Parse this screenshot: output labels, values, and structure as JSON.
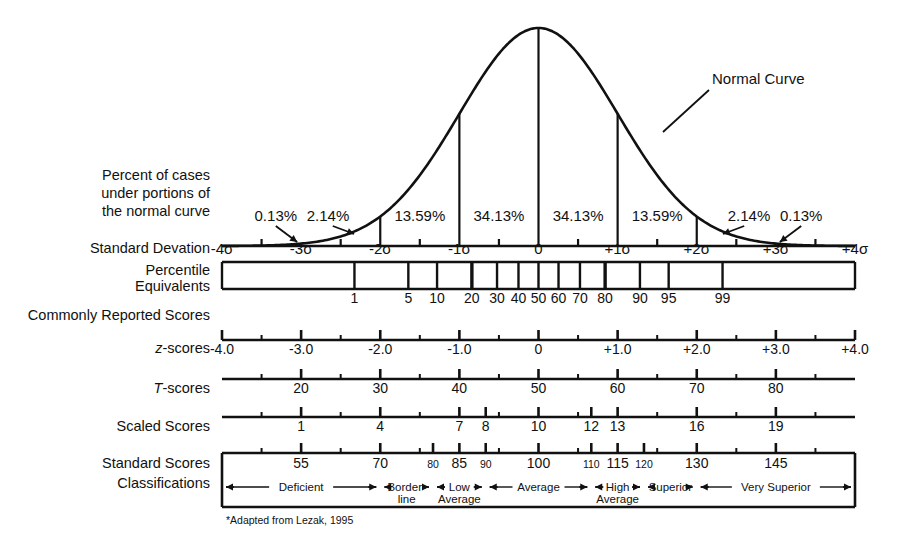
{
  "figure": {
    "curve_label": "Normal Curve",
    "footnote": "*Adapted from Lezak, 1995",
    "ink_color": "#111111",
    "background": "#ffffff"
  },
  "row_labels": {
    "percent_of_cases": [
      "Percent of cases",
      "under portions of",
      "the normal curve"
    ],
    "standard_deviation": "Standard Devation",
    "percentile": [
      "Percentile",
      "Equivalents"
    ],
    "commonly_reported": "Commonly Reported Scores",
    "z_scores_prefix": "z",
    "z_scores_suffix": "-scores",
    "t_scores_prefix": "T",
    "t_scores_suffix": "-scores",
    "scaled_scores": "Scaled Scores",
    "standard_scores": "Standard Scores",
    "classifications": "Classifications"
  },
  "chart_data": {
    "type": "line",
    "title": "Normal Curve",
    "xlabel": "Standard Deviation",
    "ylabel": "",
    "xlim": [
      -4,
      4
    ],
    "grid": false,
    "legend": "none",
    "distribution": "standard normal (gaussian)",
    "percent_of_cases": {
      "labels": [
        "0.13%",
        "2.14%",
        "13.59%",
        "34.13%",
        "34.13%",
        "13.59%",
        "2.14%",
        "0.13%"
      ],
      "bands_sigma": [
        [
          -4,
          -3
        ],
        [
          -3,
          -2
        ],
        [
          -2,
          -1
        ],
        [
          -1,
          0
        ],
        [
          0,
          1
        ],
        [
          1,
          2
        ],
        [
          2,
          3
        ],
        [
          3,
          4
        ]
      ],
      "values": [
        0.13,
        2.14,
        13.59,
        34.13,
        34.13,
        13.59,
        2.14,
        0.13
      ],
      "arrow_labels": [
        "0.13%",
        "2.14%",
        "2.14%",
        "0.13%"
      ]
    },
    "scales": [
      {
        "name": "Standard Deviation",
        "tick_labels": [
          "-4σ",
          "-3σ",
          "-2σ",
          "-1σ",
          "0",
          "+1σ",
          "+2σ",
          "+3σ",
          "+4σ"
        ],
        "tick_z": [
          -4,
          -3,
          -2,
          -1,
          0,
          1,
          2,
          3,
          4
        ],
        "minor_z": [
          -3.5,
          -2.5,
          -1.5,
          -0.5,
          0.5,
          1.5,
          2.5,
          3.5
        ]
      },
      {
        "name": "Percentile Equivalents",
        "tick_labels": [
          "1",
          "5",
          "10",
          "20",
          "30",
          "40",
          "50",
          "60",
          "70",
          "80",
          "90",
          "95",
          "99"
        ],
        "tick_percentiles": [
          1,
          5,
          10,
          20,
          30,
          40,
          50,
          60,
          70,
          80,
          90,
          95,
          99
        ],
        "tick_z": [
          -2.326,
          -1.645,
          -1.282,
          -0.842,
          -0.524,
          -0.253,
          0,
          0.253,
          0.524,
          0.842,
          1.282,
          1.645,
          2.326
        ],
        "emphasized": [
          "20",
          "80"
        ]
      },
      {
        "name": "z-scores",
        "tick_labels": [
          "-4.0",
          "-3.0",
          "-2.0",
          "-1.0",
          "0",
          "+1.0",
          "+2.0",
          "+3.0",
          "+4.0"
        ],
        "tick_z": [
          -4,
          -3,
          -2,
          -1,
          0,
          1,
          2,
          3,
          4
        ],
        "minor_z": [
          -3.5,
          -2.5,
          -1.5,
          -0.5,
          0.5,
          1.5,
          2.5,
          3.5
        ]
      },
      {
        "name": "T-scores",
        "tick_labels": [
          "20",
          "30",
          "40",
          "50",
          "60",
          "70",
          "80"
        ],
        "tick_values": [
          20,
          30,
          40,
          50,
          60,
          70,
          80
        ],
        "tick_z": [
          -3,
          -2,
          -1,
          0,
          1,
          2,
          3
        ],
        "minor_z": [
          -3.5,
          -2.5,
          -1.5,
          -0.5,
          0.5,
          1.5,
          2.5,
          3.5
        ]
      },
      {
        "name": "Scaled Scores",
        "tick_labels": [
          "1",
          "4",
          "7",
          "8",
          "10",
          "12",
          "13",
          "16",
          "19"
        ],
        "tick_values": [
          1,
          4,
          7,
          8,
          10,
          12,
          13,
          16,
          19
        ],
        "tick_z": [
          -3,
          -2,
          -1,
          -0.667,
          0,
          0.667,
          1,
          2,
          3
        ],
        "minor_z": [
          -3.5,
          -2.5,
          -1.5,
          -0.5,
          0.5,
          1.5,
          2.5,
          3.5
        ]
      },
      {
        "name": "Standard Scores",
        "tick_labels": [
          "55",
          "70",
          "80",
          "85",
          "90",
          "100",
          "110",
          "115",
          "120",
          "130",
          "145"
        ],
        "tick_values": [
          55,
          70,
          80,
          85,
          90,
          100,
          110,
          115,
          120,
          130,
          145
        ],
        "tick_z": [
          -3,
          -2,
          -1.333,
          -1,
          -0.667,
          0,
          0.667,
          1,
          1.333,
          2,
          3
        ],
        "small_labels": [
          "80",
          "90",
          "110",
          "120"
        ],
        "minor_z": [
          -3.5,
          -2.5,
          -1.5,
          -0.5,
          0.5,
          1.5,
          2.5,
          3.5
        ]
      }
    ],
    "classifications": [
      {
        "label": "Deficient",
        "lines": [
          "Deficient"
        ],
        "z_start": -4.0,
        "z_end": -2.0
      },
      {
        "label": "Border-line",
        "lines": [
          "Border-",
          "line"
        ],
        "z_start": -2.0,
        "z_end": -1.333
      },
      {
        "label": "Low Average",
        "lines": [
          "Low",
          "Average"
        ],
        "z_start": -1.333,
        "z_end": -0.667
      },
      {
        "label": "Average",
        "lines": [
          "Average"
        ],
        "z_start": -0.667,
        "z_end": 0.667
      },
      {
        "label": "High Average",
        "lines": [
          "High",
          "Average"
        ],
        "z_start": 0.667,
        "z_end": 1.333
      },
      {
        "label": "Superior",
        "lines": [
          "Superior"
        ],
        "z_start": 1.333,
        "z_end": 2.0
      },
      {
        "label": "Very Superior",
        "lines": [
          "Very Superior"
        ],
        "z_start": 2.0,
        "z_end": 4.0
      }
    ]
  }
}
